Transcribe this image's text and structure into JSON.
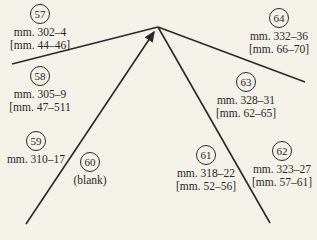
{
  "nodes": [
    {
      "id": "57",
      "line1": "mm. 302–4",
      "line2": "[mm. 44–46]"
    },
    {
      "id": "58",
      "line1": "mm. 305–9",
      "line2": "[mm. 47–511"
    },
    {
      "id": "59",
      "line1": "mm. 310–17",
      "line2": ""
    },
    {
      "id": "60",
      "line1": "(blank)",
      "line2": ""
    },
    {
      "id": "61",
      "line1": "mm. 318–22",
      "line2": "[mm. 52–56]"
    },
    {
      "id": "62",
      "line1": "mm. 323–27",
      "line2": "[mm. 57–61]"
    },
    {
      "id": "63",
      "line1": "mm. 328–31",
      "line2": "[mm. 62–65]"
    },
    {
      "id": "64",
      "line1": "mm. 332–36",
      "line2": "[mm. 66–70]"
    }
  ],
  "colors": {
    "background": "#f3f1e8",
    "ink": "#2a2a2a"
  }
}
